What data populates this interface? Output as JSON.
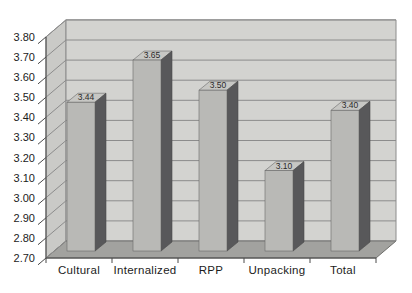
{
  "chart_data": {
    "type": "bar",
    "style_3d": true,
    "title": "",
    "xlabel": "",
    "ylabel": "",
    "categories": [
      "Cultural",
      "Internalized",
      "RPP",
      "Unpacking",
      "Total"
    ],
    "values": [
      3.44,
      3.65,
      3.5,
      3.1,
      3.4
    ],
    "data_labels": [
      "3.44",
      "3.65",
      "3.50",
      "3.10",
      "3.40"
    ],
    "ylim": [
      2.7,
      3.8
    ],
    "ytick_step": 0.1,
    "ytick_labels": [
      "3.80",
      "3.70",
      "3.60",
      "3.50",
      "3.40",
      "3.30",
      "3.20",
      "3.10",
      "3.00",
      "2.90",
      "2.80",
      "2.70"
    ],
    "grid": true,
    "legend": false,
    "colors": {
      "back_wall": "#d3d3d0",
      "side_wall": "#cacac7",
      "floor": "#a2a29f",
      "gridline": "#8c8c8c",
      "axis_line": "#4a4a4a",
      "bar_front": "#b9b9b6",
      "bar_side": "#58585a",
      "bar_top": "#c7c7c4",
      "text": "#1c1c1c"
    }
  }
}
